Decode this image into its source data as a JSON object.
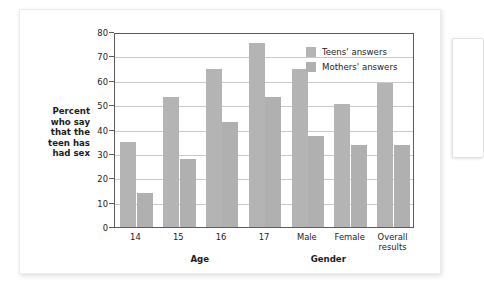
{
  "chart_data": {
    "type": "bar",
    "title": "",
    "subtitle": "",
    "xlabel": "",
    "ylabel": "Percent who say that the teen has had sex",
    "ylabel_lines": [
      "Percent",
      "who say",
      "that the",
      "teen has",
      "had sex"
    ],
    "ylim": [
      0,
      80
    ],
    "yticks": [
      0,
      10,
      20,
      30,
      40,
      50,
      60,
      70,
      80
    ],
    "ytick_labels": [
      "0",
      "10",
      "20",
      "30",
      "40",
      "50",
      "60",
      "70",
      "80"
    ],
    "grid": true,
    "grid_axis": "y",
    "legend_position": "top-right",
    "categories": [
      "14",
      "15",
      "16",
      "17",
      "Male",
      "Female",
      "Overall results"
    ],
    "category_label_lines": [
      [
        "14"
      ],
      [
        "15"
      ],
      [
        "16"
      ],
      [
        "17"
      ],
      [
        "Male"
      ],
      [
        "Female"
      ],
      [
        "Overall",
        "results"
      ]
    ],
    "group_labels": [
      {
        "label": "Age",
        "spans": [
          "14",
          "15",
          "16",
          "17"
        ]
      },
      {
        "label": "Gender",
        "spans": [
          "Male",
          "Female"
        ]
      }
    ],
    "series": [
      {
        "name": "Teens' answers",
        "color": "#b4b4b4",
        "values": [
          35,
          53.5,
          65,
          75.5,
          65,
          50.5,
          59
        ]
      },
      {
        "name": "Mothers' answers",
        "color": "#b0b0b0",
        "values": [
          14,
          28,
          43,
          53.5,
          37.5,
          33.5,
          33.5
        ]
      }
    ]
  },
  "colors": {
    "teens_bar": "#b4b4b4",
    "mothers_bar": "#b0b0b0",
    "axis": "#5c5c5c",
    "gridline": "#c9c9c9",
    "text": "#1c1c1c",
    "card_background": "#ffffff",
    "page_background": "#ffffff"
  }
}
